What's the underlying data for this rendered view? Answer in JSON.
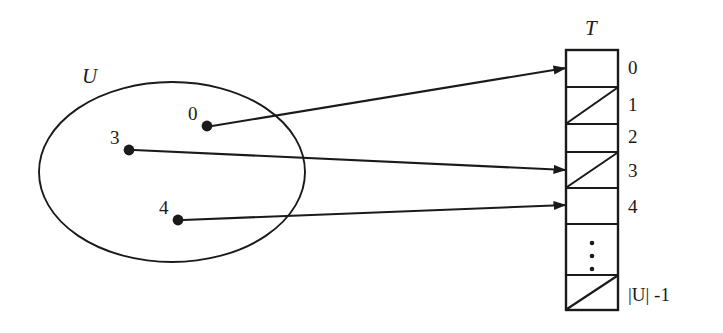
{
  "figure": {
    "background_color": "#ffffff",
    "stroke_color": "#1a1a1a"
  },
  "universe": {
    "label": "U",
    "label_name": "universe-label",
    "elements": [
      {
        "key": "0",
        "cx": 207,
        "cy": 126,
        "label_x": 188,
        "label_y": 112
      },
      {
        "key": "3",
        "cx": 129,
        "cy": 150,
        "label_x": 110,
        "label_y": 136
      },
      {
        "key": "4",
        "cx": 178,
        "cy": 220,
        "label_x": 159,
        "label_y": 206
      }
    ],
    "ellipse": {
      "cx": 172,
      "cy": 172,
      "rx": 133,
      "ry": 90
    }
  },
  "table": {
    "label": "T",
    "label_name": "table-label",
    "left": 566,
    "top": 50,
    "width": 52,
    "height": 260,
    "slots": [
      {
        "label": "0",
        "filled": true,
        "slashed": false
      },
      {
        "label": "1",
        "filled": false,
        "slashed": true
      },
      {
        "label": "2",
        "filled": false,
        "slashed": true
      },
      {
        "label": "3",
        "filled": true,
        "slashed": false
      },
      {
        "label": "4",
        "filled": true,
        "slashed": false
      },
      {
        "label": "",
        "filled": false,
        "slashed": false,
        "ellipsis": true
      },
      {
        "label": "|U| -1",
        "filled": false,
        "slashed": true
      }
    ]
  },
  "arrows": [
    {
      "name": "arrow-key-0-to-slot-0",
      "from_key": "0",
      "to_slot": "0",
      "x1": 212,
      "y1": 126,
      "x2": 564,
      "y2": 68
    },
    {
      "name": "arrow-key-3-to-slot-3",
      "from_key": "3",
      "to_slot": "3",
      "x1": 134,
      "y1": 150,
      "x2": 564,
      "y2": 170
    },
    {
      "name": "arrow-key-4-to-slot-4",
      "from_key": "4",
      "to_slot": "4",
      "x1": 183,
      "y1": 220,
      "x2": 564,
      "y2": 205
    }
  ],
  "ellipsis_dots": {
    "count": 3,
    "x": 592,
    "ys": [
      262,
      276,
      290
    ]
  }
}
